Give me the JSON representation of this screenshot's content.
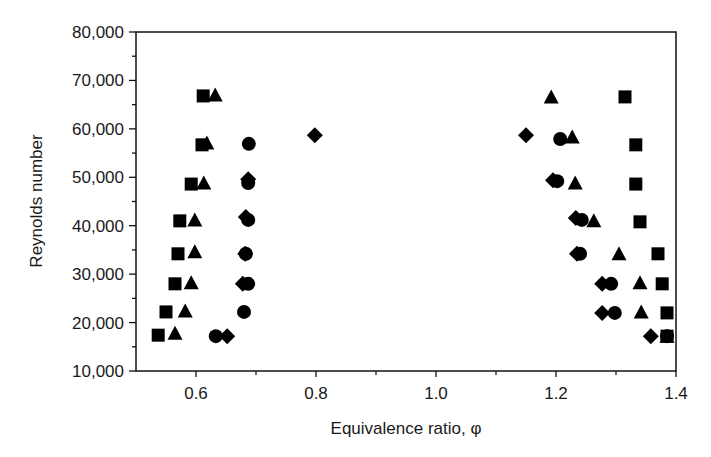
{
  "chart_data": {
    "type": "scatter",
    "title": "",
    "xlabel": "Equivalence ratio, φ",
    "ylabel": "Reynolds number",
    "xlim": [
      0.5,
      1.4
    ],
    "ylim": [
      10000,
      80000
    ],
    "x_ticks": [
      0.6,
      0.8,
      1.0,
      1.2,
      1.4
    ],
    "x_tick_labels": [
      "0.6",
      "0.8",
      "1.0",
      "1.2",
      "1.4"
    ],
    "x_minor_ticks": [
      0.7,
      0.9,
      1.1,
      1.3
    ],
    "y_ticks": [
      10000,
      20000,
      30000,
      40000,
      50000,
      60000,
      70000,
      80000
    ],
    "y_tick_labels": [
      "10,000",
      "20,000",
      "30,000",
      "40,000",
      "50,000",
      "60,000",
      "70,000",
      "80,000"
    ],
    "y_minor_ticks": [
      15000,
      25000,
      35000,
      45000,
      55000,
      65000,
      75000
    ],
    "grid": false,
    "legend": null,
    "series": [
      {
        "name": "square",
        "marker": "square",
        "points": [
          [
            0.612,
            66800
          ],
          [
            0.61,
            56700
          ],
          [
            0.592,
            48600
          ],
          [
            0.573,
            41000
          ],
          [
            0.57,
            34200
          ],
          [
            0.565,
            28000
          ],
          [
            0.55,
            22200
          ],
          [
            0.537,
            17400
          ],
          [
            1.315,
            66600
          ],
          [
            1.333,
            56700
          ],
          [
            1.333,
            48600
          ],
          [
            1.34,
            40800
          ],
          [
            1.37,
            34200
          ],
          [
            1.377,
            28000
          ],
          [
            1.385,
            22000
          ],
          [
            1.385,
            17200
          ]
        ]
      },
      {
        "name": "triangle",
        "marker": "triangle",
        "points": [
          [
            0.632,
            67000
          ],
          [
            0.618,
            57100
          ],
          [
            0.613,
            48800
          ],
          [
            0.598,
            41200
          ],
          [
            0.598,
            34600
          ],
          [
            0.592,
            28200
          ],
          [
            0.582,
            22400
          ],
          [
            0.565,
            17800
          ],
          [
            1.192,
            66600
          ],
          [
            1.227,
            58300
          ],
          [
            1.232,
            48800
          ],
          [
            1.263,
            41000
          ],
          [
            1.305,
            34200
          ],
          [
            1.34,
            28200
          ],
          [
            1.342,
            22200
          ],
          [
            1.385,
            17200
          ]
        ]
      },
      {
        "name": "circle",
        "marker": "circle",
        "points": [
          [
            0.688,
            56900
          ],
          [
            0.687,
            48800
          ],
          [
            0.687,
            41200
          ],
          [
            0.683,
            34200
          ],
          [
            0.687,
            28000
          ],
          [
            0.68,
            22200
          ],
          [
            0.633,
            17200
          ],
          [
            1.207,
            57900
          ],
          [
            1.202,
            49200
          ],
          [
            1.243,
            41200
          ],
          [
            1.24,
            34200
          ],
          [
            1.292,
            28000
          ],
          [
            1.298,
            22000
          ],
          [
            1.385,
            17200
          ]
        ]
      },
      {
        "name": "diamond",
        "marker": "diamond",
        "points": [
          [
            0.798,
            58700
          ],
          [
            0.687,
            49600
          ],
          [
            0.683,
            41800
          ],
          [
            0.682,
            34200
          ],
          [
            0.678,
            28000
          ],
          [
            0.652,
            17200
          ],
          [
            1.15,
            58700
          ],
          [
            1.195,
            49400
          ],
          [
            1.233,
            41600
          ],
          [
            1.235,
            34200
          ],
          [
            1.277,
            28000
          ],
          [
            1.277,
            22000
          ],
          [
            1.358,
            17200
          ]
        ]
      }
    ]
  }
}
